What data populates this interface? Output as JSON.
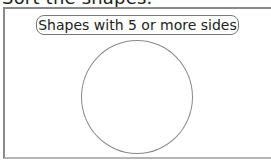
{
  "heading": {
    "text": "Sort the shapes."
  },
  "sort_box": {
    "label": "Shapes with 5 or more sides",
    "border_color": "#8a8a8a"
  },
  "shapes": [
    {
      "type": "circle",
      "stroke_color": "#888888"
    }
  ]
}
